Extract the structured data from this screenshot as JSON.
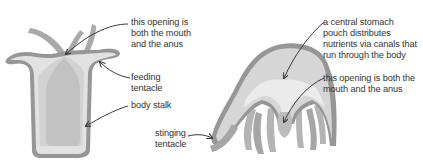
{
  "diagram": {
    "colors": {
      "outline": "#8f8f8f",
      "body_fill": "#d6d6d6",
      "inner_band": "#ececec",
      "cavity": "#c4c4c4",
      "arrow": "#3a3a3a",
      "text": "#333333"
    },
    "hydra": {
      "labels": {
        "mouth_anus": "this opening is\nboth the mouth\nand the anus",
        "feeding_tentacle": "feeding\ntentacle",
        "body_stalk": "body stalk"
      }
    },
    "jellyfish": {
      "labels": {
        "stomach": "a central stomach\npouch distributes\nnutrients via canals that\nrun through the body",
        "mouth_anus": "this opening is both the\nmouth and the anus",
        "stinging_tentacle": "stinging\ntentacle"
      }
    }
  }
}
